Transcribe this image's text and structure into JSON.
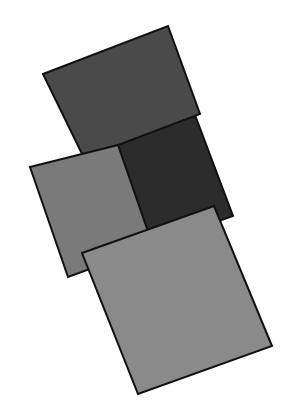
{
  "canvas": {
    "width": 294,
    "height": 416,
    "background": "#ffffff"
  },
  "shapes": [
    {
      "name": "dark-square",
      "fill": "#2c2c2c",
      "stroke": "#111111",
      "points": "118,145 195,115 233,216 150,246"
    },
    {
      "name": "top-square",
      "fill": "#4a4a4a",
      "stroke": "#111111",
      "points": "43,74 168,26 200,114 84,158"
    },
    {
      "name": "left-square",
      "fill": "#7a7a7a",
      "stroke": "#111111",
      "points": "30,167 118,145 153,246 68,277"
    },
    {
      "name": "bottom-square",
      "fill": "#8a8a8a",
      "stroke": "#111111",
      "points": "82,253 214,206 272,346 138,394"
    }
  ]
}
